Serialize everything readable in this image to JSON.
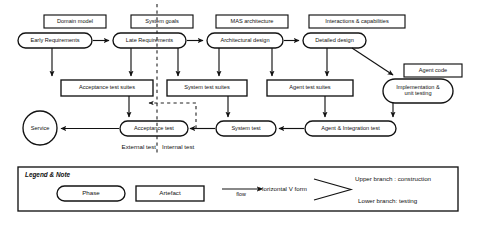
{
  "diagram": {
    "title_hidden": "",
    "phases": [
      {
        "id": "early-requirements",
        "label": "Early Requirements",
        "shape": "stadium",
        "x": 18,
        "y": 33,
        "w": 74,
        "h": 15
      },
      {
        "id": "late-requirements",
        "label": "Late Requirements",
        "shape": "stadium",
        "x": 113,
        "y": 33,
        "w": 73,
        "h": 15
      },
      {
        "id": "architectural-design",
        "label": "Architectural design",
        "shape": "stadium",
        "x": 207,
        "y": 33,
        "w": 76,
        "h": 15
      },
      {
        "id": "detailed-design",
        "label": "Detailed design",
        "shape": "stadium",
        "x": 303,
        "y": 33,
        "w": 63,
        "h": 15
      },
      {
        "id": "implementation-unit-testing",
        "label": "Implementation &\nunit testing",
        "shape": "stadium",
        "x": 383,
        "y": 79,
        "w": 70,
        "h": 24
      }
    ],
    "artefacts_top": [
      {
        "id": "domain-model",
        "label": "Domain model",
        "x": 44,
        "y": 15,
        "w": 62,
        "h": 13
      },
      {
        "id": "system-goals",
        "label": "System goals",
        "x": 131,
        "y": 15,
        "w": 62,
        "h": 13
      },
      {
        "id": "mas-architecture",
        "label": "MAS architecture",
        "x": 216,
        "y": 15,
        "w": 72,
        "h": 13
      },
      {
        "id": "interactions-capabilities",
        "label": "Interactions & capabilities",
        "x": 309,
        "y": 15,
        "w": 96,
        "h": 13
      },
      {
        "id": "agent-code",
        "label": "Agent code",
        "x": 404,
        "y": 64,
        "w": 58,
        "h": 13
      }
    ],
    "artefacts_suites": [
      {
        "id": "acceptance-test-suites",
        "label": "Acceptance test suites",
        "x": 61,
        "y": 80,
        "w": 92,
        "h": 16
      },
      {
        "id": "system-test-suites",
        "label": "System test suites",
        "x": 167,
        "y": 80,
        "w": 80,
        "h": 16
      },
      {
        "id": "agent-test-suites",
        "label": "Agent test suites",
        "x": 267,
        "y": 80,
        "w": 86,
        "h": 16
      }
    ],
    "tests": [
      {
        "id": "acceptance-test",
        "label": "Acceptance test",
        "shape": "stadium",
        "x": 120,
        "y": 121,
        "w": 68,
        "h": 15
      },
      {
        "id": "system-test",
        "label": "System test",
        "shape": "stadium",
        "x": 216,
        "y": 121,
        "w": 60,
        "h": 15
      },
      {
        "id": "agent-integration-test",
        "label": "Agent & Integration test",
        "shape": "stadium",
        "x": 305,
        "y": 121,
        "w": 91,
        "h": 15
      }
    ],
    "service": {
      "id": "service",
      "label": "Service",
      "shape": "circle",
      "cx": 40,
      "cy": 128,
      "r": 17
    },
    "free_labels": [
      {
        "id": "external-test",
        "label": "External test",
        "x": 131,
        "y": 147
      },
      {
        "id": "internal-test",
        "label": "Internal test",
        "x": 166,
        "y": 147
      }
    ],
    "divider": {
      "id": "internal-external-divider",
      "x": 157,
      "top": 4,
      "bottom": 155
    }
  },
  "legend": {
    "title": "Legend & Note",
    "box": {
      "x": 18,
      "y": 167,
      "w": 440,
      "h": 44
    },
    "phase_label": "Phase",
    "artefact_label": "Artefact",
    "flow_label": "flow",
    "v_form_label": "Horizontal V form",
    "upper_branch_label": "Upper branch : construction",
    "lower_branch_label": "Lower branch: testing"
  },
  "style": {
    "stroke": "#121212",
    "fill": "#ffffff",
    "dashed_stroke": "#222222"
  }
}
